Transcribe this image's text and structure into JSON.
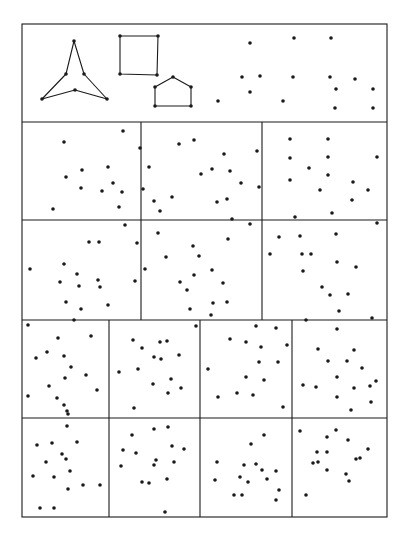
{
  "figure": {
    "width": 405,
    "height": 545,
    "ink_color": "#1a1a1a",
    "background": "#ffffff",
    "dot_radius": 1.8,
    "line_width": 1.1,
    "frame": {
      "x1": 22,
      "y1": 24,
      "x2": 387,
      "y2": 517
    },
    "row_lines": [
      122,
      220,
      320,
      418
    ],
    "col_lines": [
      {
        "x": 141,
        "y1": 122,
        "y2": 320
      },
      {
        "x": 262,
        "y1": 122,
        "y2": 320
      },
      {
        "x": 109,
        "y1": 320,
        "y2": 517
      },
      {
        "x": 200,
        "y1": 320,
        "y2": 517
      },
      {
        "x": 292,
        "y1": 320,
        "y2": 517
      }
    ]
  },
  "example_panel": {
    "shapes": [
      {
        "name": "tripod-star",
        "closed": true,
        "points": [
          [
            74,
            41
          ],
          [
            66,
            74
          ],
          [
            42,
            99
          ],
          [
            75,
            90
          ],
          [
            107,
            99
          ],
          [
            84,
            74
          ]
        ]
      },
      {
        "name": "square",
        "closed": true,
        "points": [
          [
            120,
            36
          ],
          [
            158,
            36
          ],
          [
            157,
            75
          ],
          [
            120,
            74
          ]
        ]
      },
      {
        "name": "house-pentagon",
        "closed": true,
        "points": [
          [
            155,
            87
          ],
          [
            173,
            77
          ],
          [
            191,
            87
          ],
          [
            191,
            106
          ],
          [
            155,
            106
          ]
        ]
      }
    ],
    "loose_dots": [
      [
        250,
        43
      ],
      [
        294,
        38
      ],
      [
        331,
        38
      ],
      [
        242,
        77
      ],
      [
        260,
        76
      ],
      [
        293,
        77
      ],
      [
        330,
        77
      ],
      [
        355,
        79
      ],
      [
        250,
        92
      ],
      [
        218,
        101
      ],
      [
        283,
        101
      ],
      [
        336,
        89
      ],
      [
        373,
        89
      ],
      [
        335,
        108
      ],
      [
        373,
        108
      ]
    ]
  },
  "panels": [
    {
      "id": "r2c1",
      "x": 22,
      "y": 122,
      "w": 119,
      "h": 98,
      "dots": [
        [
          42,
          20
        ],
        [
          101,
          9
        ],
        [
          118,
          26
        ],
        [
          60,
          48
        ],
        [
          86,
          45
        ],
        [
          44,
          55
        ],
        [
          59,
          66
        ],
        [
          91,
          61
        ],
        [
          80,
          69
        ],
        [
          121,
          67
        ],
        [
          100,
          70
        ],
        [
          132,
          79
        ],
        [
          31,
          87
        ],
        [
          97,
          85
        ],
        [
          138,
          89
        ],
        [
          103,
          103
        ]
      ]
    },
    {
      "id": "r2c2",
      "x": 141,
      "y": 122,
      "w": 121,
      "h": 98,
      "dots": [
        [
          38,
          22
        ],
        [
          53,
          18
        ],
        [
          83,
          32
        ],
        [
          116,
          29
        ],
        [
          8,
          45
        ],
        [
          71,
          47
        ],
        [
          60,
          52
        ],
        [
          89,
          49
        ],
        [
          100,
          61
        ],
        [
          118,
          65
        ],
        [
          31,
          75
        ],
        [
          76,
          80
        ],
        [
          86,
          77
        ],
        [
          91,
          97
        ],
        [
          109,
          102
        ]
      ]
    },
    {
      "id": "r2c3",
      "x": 262,
      "y": 122,
      "w": 125,
      "h": 98,
      "dots": [
        [
          28,
          17
        ],
        [
          66,
          17
        ],
        [
          28,
          36
        ],
        [
          66,
          35
        ],
        [
          115,
          35
        ],
        [
          47,
          46
        ],
        [
          66,
          53
        ],
        [
          28,
          58
        ],
        [
          91,
          60
        ],
        [
          58,
          68
        ],
        [
          106,
          68
        ],
        [
          90,
          78
        ],
        [
          33,
          95
        ],
        [
          70,
          91
        ],
        [
          115,
          101
        ]
      ]
    },
    {
      "id": "r3c1",
      "x": 22,
      "y": 220,
      "w": 119,
      "h": 100,
      "dots": [
        [
          67,
          22
        ],
        [
          77,
          22
        ],
        [
          115,
          23
        ],
        [
          42,
          44
        ],
        [
          8,
          49
        ],
        [
          55,
          54
        ],
        [
          38,
          62
        ],
        [
          76,
          60
        ],
        [
          57,
          66
        ],
        [
          78,
          67
        ],
        [
          113,
          61
        ],
        [
          44,
          82
        ],
        [
          59,
          89
        ],
        [
          86,
          85
        ],
        [
          52,
          100
        ]
      ]
    },
    {
      "id": "r3c2",
      "x": 141,
      "y": 220,
      "w": 121,
      "h": 100,
      "dots": [
        [
          17,
          13
        ],
        [
          87,
          19
        ],
        [
          52,
          26
        ],
        [
          25,
          37
        ],
        [
          58,
          36
        ],
        [
          4,
          49
        ],
        [
          71,
          50
        ],
        [
          53,
          55
        ],
        [
          39,
          62
        ],
        [
          82,
          63
        ],
        [
          46,
          70
        ],
        [
          72,
          83
        ],
        [
          86,
          82
        ],
        [
          49,
          89
        ],
        [
          70,
          95
        ]
      ]
    },
    {
      "id": "r3c3",
      "x": 262,
      "y": 220,
      "w": 125,
      "h": 100,
      "dots": [
        [
          17,
          17
        ],
        [
          38,
          16
        ],
        [
          74,
          14
        ],
        [
          8,
          34
        ],
        [
          40,
          34
        ],
        [
          49,
          34
        ],
        [
          75,
          42
        ],
        [
          94,
          47
        ],
        [
          41,
          51
        ],
        [
          60,
          67
        ],
        [
          68,
          75
        ],
        [
          86,
          74
        ],
        [
          77,
          91
        ],
        [
          44,
          100
        ],
        [
          110,
          98
        ]
      ]
    },
    {
      "id": "r4c1",
      "x": 22,
      "y": 320,
      "w": 87,
      "h": 98,
      "dots": [
        [
          6,
          5
        ],
        [
          36,
          18
        ],
        [
          69,
          16
        ],
        [
          25,
          32
        ],
        [
          14,
          38
        ],
        [
          42,
          36
        ],
        [
          49,
          47
        ],
        [
          43,
          58
        ],
        [
          64,
          55
        ],
        [
          27,
          66
        ],
        [
          75,
          70
        ],
        [
          6,
          76
        ],
        [
          35,
          78
        ],
        [
          42,
          85
        ],
        [
          46,
          94
        ]
      ]
    },
    {
      "id": "r4c2",
      "x": 109,
      "y": 320,
      "w": 91,
      "h": 98,
      "dots": [
        [
          87,
          6
        ],
        [
          24,
          20
        ],
        [
          33,
          28
        ],
        [
          51,
          22
        ],
        [
          58,
          21
        ],
        [
          45,
          37
        ],
        [
          52,
          39
        ],
        [
          70,
          35
        ],
        [
          10,
          52
        ],
        [
          29,
          49
        ],
        [
          62,
          59
        ],
        [
          44,
          64
        ],
        [
          72,
          68
        ],
        [
          59,
          73
        ],
        [
          25,
          88
        ]
      ]
    },
    {
      "id": "r4c3",
      "x": 200,
      "y": 320,
      "w": 92,
      "h": 98,
      "dots": [
        [
          56,
          6
        ],
        [
          76,
          8
        ],
        [
          30,
          19
        ],
        [
          46,
          22
        ],
        [
          61,
          27
        ],
        [
          87,
          25
        ],
        [
          8,
          49
        ],
        [
          59,
          42
        ],
        [
          78,
          42
        ],
        [
          46,
          57
        ],
        [
          64,
          60
        ],
        [
          18,
          77
        ],
        [
          37,
          73
        ],
        [
          53,
          75
        ],
        [
          83,
          87
        ]
      ]
    },
    {
      "id": "r4c4",
      "x": 292,
      "y": 320,
      "w": 95,
      "h": 98,
      "dots": [
        [
          45,
          9
        ],
        [
          26,
          29
        ],
        [
          62,
          30
        ],
        [
          36,
          41
        ],
        [
          55,
          41
        ],
        [
          70,
          48
        ],
        [
          45,
          57
        ],
        [
          11,
          65
        ],
        [
          24,
          67
        ],
        [
          62,
          68
        ],
        [
          78,
          66
        ],
        [
          84,
          61
        ],
        [
          45,
          77
        ],
        [
          79,
          82
        ],
        [
          59,
          90
        ]
      ]
    },
    {
      "id": "r5c1",
      "x": 22,
      "y": 418,
      "w": 87,
      "h": 99,
      "dots": [
        [
          45,
          -7
        ],
        [
          45,
          8
        ],
        [
          15,
          27
        ],
        [
          30,
          25
        ],
        [
          55,
          24
        ],
        [
          40,
          36
        ],
        [
          44,
          41
        ],
        [
          24,
          44
        ],
        [
          48,
          53
        ],
        [
          11,
          58
        ],
        [
          32,
          59
        ],
        [
          61,
          67
        ],
        [
          78,
          67
        ],
        [
          46,
          71
        ],
        [
          18,
          90
        ],
        [
          32,
          90
        ]
      ]
    },
    {
      "id": "r5c2",
      "x": 109,
      "y": 418,
      "w": 91,
      "h": 99,
      "dots": [
        [
          45,
          11
        ],
        [
          59,
          9
        ],
        [
          23,
          17
        ],
        [
          14,
          32
        ],
        [
          27,
          35
        ],
        [
          63,
          28
        ],
        [
          75,
          31
        ],
        [
          47,
          42
        ],
        [
          45,
          47
        ],
        [
          65,
          44
        ],
        [
          12,
          48
        ],
        [
          58,
          61
        ],
        [
          33,
          64
        ],
        [
          40,
          65
        ],
        [
          56,
          94
        ]
      ]
    },
    {
      "id": "r5c3",
      "x": 200,
      "y": 418,
      "w": 92,
      "h": 99,
      "dots": [
        [
          64,
          17
        ],
        [
          51,
          26
        ],
        [
          17,
          44
        ],
        [
          44,
          47
        ],
        [
          56,
          46
        ],
        [
          62,
          52
        ],
        [
          76,
          53
        ],
        [
          15,
          62
        ],
        [
          40,
          59
        ],
        [
          48,
          64
        ],
        [
          67,
          61
        ],
        [
          79,
          72
        ],
        [
          34,
          77
        ],
        [
          42,
          77
        ],
        [
          76,
          82
        ]
      ]
    },
    {
      "id": "r5c4",
      "x": 292,
      "y": 418,
      "w": 95,
      "h": 99,
      "dots": [
        [
          8,
          13
        ],
        [
          44,
          12
        ],
        [
          35,
          19
        ],
        [
          56,
          22
        ],
        [
          25,
          34
        ],
        [
          35,
          34
        ],
        [
          76,
          31
        ],
        [
          21,
          45
        ],
        [
          26,
          44
        ],
        [
          64,
          41
        ],
        [
          68,
          40
        ],
        [
          35,
          52
        ],
        [
          54,
          56
        ],
        [
          57,
          63
        ],
        [
          14,
          77
        ]
      ]
    }
  ]
}
